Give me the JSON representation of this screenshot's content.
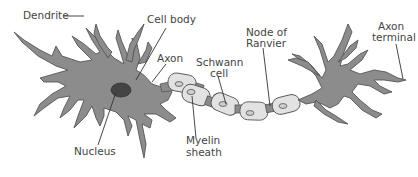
{
  "diagram": {
    "colors": {
      "cell_fill": "#8c8c8c",
      "outline": "#555555",
      "nucleus": "#444444",
      "myelin": "#e2e2e2",
      "label_text": "#444444",
      "background": "#ffffff"
    },
    "labels": [
      {
        "id": "dendrite",
        "text": "Dendrite"
      },
      {
        "id": "cell_body",
        "text": "Cell body"
      },
      {
        "id": "axon",
        "text": "Axon"
      },
      {
        "id": "schwann_cell_1",
        "text": "Schwann"
      },
      {
        "id": "schwann_cell_2",
        "text": "cell"
      },
      {
        "id": "node_of_ranvier_1",
        "text": "Node of"
      },
      {
        "id": "node_of_ranvier_2",
        "text": "Ranvier"
      },
      {
        "id": "axon_terminal_1",
        "text": "Axon"
      },
      {
        "id": "axon_terminal_2",
        "text": "terminal"
      },
      {
        "id": "nucleus",
        "text": "Nucleus"
      },
      {
        "id": "myelin_sheath_1",
        "text": "Myelin"
      },
      {
        "id": "myelin_sheath_2",
        "text": "sheath"
      }
    ]
  }
}
